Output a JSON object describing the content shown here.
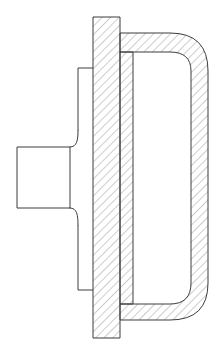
{
  "document": {
    "title": "Sectional View",
    "view_type": "cross-section",
    "projection": "half-section",
    "background_color": "#ffffff",
    "line_color": "#3c3c3c",
    "hatch_color": "#6e6e78",
    "canvas": {
      "width": 223,
      "height": 353
    }
  },
  "drawing": {
    "name": "axisymmetric-housing-section",
    "units": "px",
    "stroke_width": 1.0,
    "hatch": {
      "angle_deg": 45,
      "spacing": 6,
      "stroke_width": 0.7,
      "style": "iso-section-lines"
    },
    "components": [
      {
        "id": "hub-shaft",
        "name": "hub-shaft",
        "label": "Hub / Shaft Boss",
        "filled": false,
        "hatched": false,
        "path": "M 17 147 L 17 208 L 70 208 L 70 147 Z"
      },
      {
        "id": "hub-fillet-upper",
        "name": "hub-fillet-upper",
        "label": "Upper Fillet Transition",
        "filled": false,
        "hatched": false,
        "path": "M 70 147 C 77 147 78 140 78 131"
      },
      {
        "id": "hub-fillet-lower",
        "name": "hub-fillet-lower",
        "label": "Lower Fillet Transition",
        "filled": false,
        "hatched": false,
        "path": "M 70 208 C 77 208 78 215 78 225"
      },
      {
        "id": "web-plate",
        "name": "web-plate",
        "label": "Connecting Web",
        "filled": false,
        "hatched": false,
        "path": "M 78 68 L 78 131 M 78 225 L 78 290 M 78 68 L 93 68 M 78 290 L 93 290"
      },
      {
        "id": "flange-plate",
        "name": "flange-plate",
        "label": "Main Flange Plate",
        "filled": false,
        "hatched": true,
        "path": "M 93 17 L 120 17 L 120 338 L 93 338 Z"
      },
      {
        "id": "inner-wall",
        "name": "inner-wall",
        "label": "Inner Bore Wall",
        "filled": false,
        "hatched": true,
        "path": "M 120 52 L 133 52 L 133 304 L 120 304 Z"
      },
      {
        "id": "outer-shell",
        "name": "outer-shell",
        "label": "Outer Rim Shell",
        "filled": false,
        "hatched": true,
        "path": "M 120 33 L 170 33 Q 208 33 208 71 L 208 283 Q 208 320 170 320 L 120 320 L 120 304 L 170 304 Q 191 304 191 283 L 191 71 Q 191 52 170 52 L 120 52 Z"
      }
    ],
    "annotations": []
  }
}
